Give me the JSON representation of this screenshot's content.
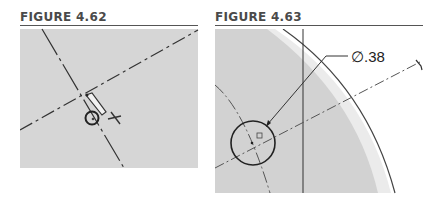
{
  "figures": [
    {
      "title": "FIGURE 4.62",
      "panel_color": "#d6d6d6",
      "elements": [
        "centerline-vertical",
        "centerline-diagonal",
        "cursor-pointer-icon",
        "circle-tool-icon",
        "crosshair-cursor-icon"
      ]
    },
    {
      "title": "FIGURE 4.63",
      "dimension_label": "∅.38",
      "panel_color": "#d2d2d2",
      "rim_color": "#ebebeb",
      "elements": [
        "arc-edge",
        "construction-arc",
        "vertical-line",
        "centerline",
        "circle",
        "leader-arrow",
        "dimension-text"
      ]
    }
  ]
}
